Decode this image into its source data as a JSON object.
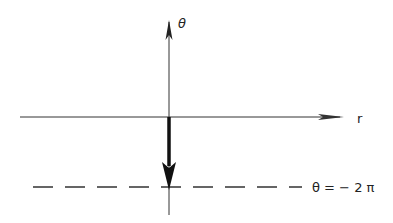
{
  "diagram": {
    "axes": {
      "vertical_label": "θ",
      "horizontal_label": "r"
    },
    "reference_line": {
      "label": "θ = − 2 π",
      "style": "dashed"
    },
    "vector": {
      "direction": "down",
      "description": "bold arrow pointing from origin toward θ = −2π"
    },
    "colors": {
      "stroke": "#222222",
      "background": "#ffffff"
    }
  }
}
